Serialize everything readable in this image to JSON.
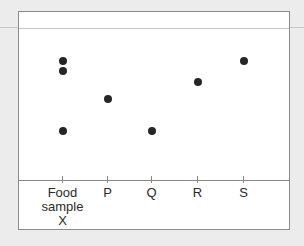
{
  "chart_data": {
    "type": "scatter",
    "title": "",
    "categories": [
      "Food sample X",
      "P",
      "Q",
      "R",
      "S"
    ],
    "xlabel": "",
    "ylabel": "",
    "grid": false,
    "legend": null,
    "baseline_y_px": 179,
    "solvent_front_y_px": 27,
    "spots": [
      {
        "lane": "Food sample X",
        "x": 62,
        "y": 60
      },
      {
        "lane": "Food sample X",
        "x": 62,
        "y": 70
      },
      {
        "lane": "Food sample X",
        "x": 62,
        "y": 130
      },
      {
        "lane": "P",
        "x": 107,
        "y": 98
      },
      {
        "lane": "Q",
        "x": 151,
        "y": 130
      },
      {
        "lane": "R",
        "x": 197,
        "y": 81
      },
      {
        "lane": "S",
        "x": 243,
        "y": 60
      }
    ]
  },
  "lanes": [
    {
      "id": "x",
      "label": "Food\nsample\nX",
      "x": 62
    },
    {
      "id": "p",
      "label": "P",
      "x": 107
    },
    {
      "id": "q",
      "label": "Q",
      "x": 151
    },
    {
      "id": "r",
      "label": "R",
      "x": 197
    },
    {
      "id": "s",
      "label": "S",
      "x": 243
    }
  ],
  "colors": {
    "background": "#ececec",
    "paper": "#ffffff",
    "spot": "#262626",
    "line": "#8a8a8a"
  }
}
